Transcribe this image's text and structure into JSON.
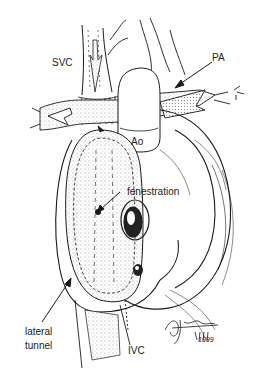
{
  "figure": {
    "labels": {
      "svc": "SVC",
      "pa": "PA",
      "ao": "Ao",
      "fenestration": "fenestration",
      "lateral_tunnel_line1": "lateral",
      "lateral_tunnel_line2": "tunnel",
      "ivc": "IVC"
    },
    "signature": {
      "year": "1999"
    },
    "colors": {
      "ink": "#1a1a1a",
      "stipple": "#b8b8b8",
      "background": "#ffffff"
    }
  }
}
